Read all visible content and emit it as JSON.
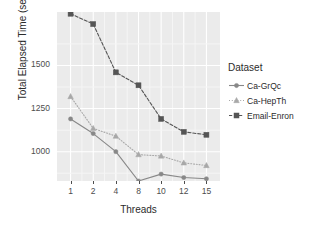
{
  "chart_data": {
    "type": "line",
    "title": "",
    "xlabel": "Threads",
    "ylabel": "Total Elapsed Time (sec)",
    "categories": [
      "1",
      "2",
      "4",
      "8",
      "10",
      "12",
      "15"
    ],
    "x": [
      1,
      2,
      4,
      8,
      10,
      12,
      15
    ],
    "xticklabels": [
      "1",
      "2",
      "4",
      "8",
      "10",
      "12",
      "15"
    ],
    "yticks": [
      1000,
      1250,
      1500
    ],
    "yticklabels": [
      "1000",
      "1250",
      "1500"
    ],
    "ylim": [
      830,
      1810
    ],
    "grid": true,
    "legend_position": "right",
    "legend_title": "Dataset",
    "series": [
      {
        "name": "Ca-GrQc",
        "marker": "circle",
        "linestyle": "solid",
        "color": "#888888",
        "values": [
          1190,
          1105,
          1000,
          830,
          870,
          850,
          843
        ]
      },
      {
        "name": "Ca-HepTh",
        "marker": "triangle",
        "linestyle": "dotted",
        "color": "#a8a8a8",
        "values": [
          1320,
          1135,
          1090,
          983,
          975,
          935,
          920
        ]
      },
      {
        "name": "Email-Enron",
        "marker": "square",
        "linestyle": "dashed",
        "color": "#555555",
        "values": [
          1800,
          1740,
          1460,
          1385,
          1190,
          1115,
          1098
        ]
      }
    ]
  },
  "axes": {
    "y_title": "Total Elapsed Time (sec)",
    "x_title": "Threads"
  },
  "legend": {
    "title": "Dataset",
    "items": [
      {
        "label": "Ca-GrQc",
        "marker": "circle-marker",
        "color": "#888888"
      },
      {
        "label": "Ca-HepTh",
        "marker": "triangle-marker",
        "color": "#a8a8a8"
      },
      {
        "label": "Email-Enron",
        "marker": "square-marker",
        "color": "#555555"
      }
    ]
  },
  "style": {
    "panel_background": "#ebebeb",
    "gridline_major": "#ffffff",
    "gridline_minor": "#f5f5f5",
    "page_background": "#ffffff",
    "text_color": "#2b2b2b"
  }
}
